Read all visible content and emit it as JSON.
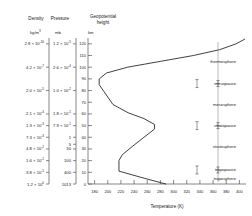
{
  "chart_data": {
    "type": "line",
    "title": "",
    "xlabel": "Temperature (K)",
    "ylabel": "Geopotential height",
    "xlim": [
      170,
      410
    ],
    "ylim": [
      0,
      125
    ],
    "grid": false,
    "legend_position": "none",
    "x_ticks": [
      180,
      200,
      220,
      240,
      260,
      280,
      300,
      320,
      340,
      360,
      380,
      400
    ],
    "y_ticks": [
      0,
      10,
      20,
      30,
      40,
      50,
      60,
      70,
      80,
      90,
      100,
      110,
      120
    ],
    "series": [
      {
        "name": "U.S. Standard Atmosphere temperature profile",
        "x": [
          288,
          255,
          217,
          217,
          222,
          237,
          255,
          271,
          271,
          255,
          231,
          208,
          187,
          187,
          198,
          230,
          280,
          330,
          370,
          395,
          408
        ],
        "y": [
          0,
          5,
          11,
          20,
          25,
          32,
          40,
          47,
          51,
          56,
          61,
          68,
          85,
          90,
          95,
          100,
          105,
          110,
          115,
          120,
          124
        ]
      }
    ],
    "annotations": [
      {
        "label": "thermosphere",
        "height": 105,
        "kind": "layer"
      },
      {
        "label": "mesopause",
        "height": 86,
        "kind": "pause"
      },
      {
        "label": "mesosphere",
        "height": 68,
        "kind": "layer"
      },
      {
        "label": "stratopause",
        "height": 50,
        "kind": "pause"
      },
      {
        "label": "stratosphere",
        "height": 32,
        "kind": "layer"
      },
      {
        "label": "tropopause",
        "height": 12,
        "kind": "pause"
      },
      {
        "label": "troposphere",
        "height": 5,
        "kind": "layer"
      }
    ]
  },
  "columns": {
    "density": {
      "header": "Density",
      "unit_mantissa": "kg/m",
      "unit_exponent": "3",
      "rows": [
        {
          "mantissa": "2.8",
          "exponent": "-10",
          "height": 120
        },
        {
          "mantissa": "4.2",
          "exponent": "-7",
          "height": 100
        },
        {
          "mantissa": "2.0",
          "exponent": "-5",
          "height": 80
        },
        {
          "mantissa": "2.1",
          "exponent": "-4",
          "height": 60
        },
        {
          "mantissa": "1.3",
          "exponent": "-3",
          "height": 50
        },
        {
          "mantissa": "7.3",
          "exponent": "-3",
          "height": 40
        },
        {
          "mantissa": "4.8",
          "exponent": "-2",
          "height": 30
        },
        {
          "mantissa": "1.6",
          "exponent": "-1",
          "height": 20
        },
        {
          "mantissa": "3.8",
          "exponent": "-1",
          "height": 10
        },
        {
          "mantissa": "1.2",
          "exponent": "0",
          "height": 0
        }
      ]
    },
    "pressure": {
      "header": "Pressure",
      "unit": "mb",
      "rows": [
        {
          "mantissa": "1.2",
          "exponent": "-5",
          "height": 120
        },
        {
          "mantissa": "2.6",
          "exponent": "-4",
          "height": 100
        },
        {
          "mantissa": "1.0",
          "exponent": "-2",
          "height": 80
        },
        {
          "mantissa": "1.8",
          "exponent": "-1",
          "height": 60
        },
        {
          "mantissa": "7.9",
          "exponent": "-1",
          "height": 50
        },
        {
          "mantissa": "1",
          "exponent": "",
          "height": 40
        },
        {
          "mantissa": "5",
          "exponent": "",
          "height": 40
        },
        {
          "mantissa": "30",
          "exponent": "",
          "height": 30
        },
        {
          "mantissa": "100",
          "exponent": "",
          "height": 20
        },
        {
          "mantissa": "400",
          "exponent": "",
          "height": 10
        },
        {
          "mantissa": "1013",
          "exponent": "",
          "height": 0
        }
      ]
    },
    "height": {
      "header_line1": "Geopotential",
      "header_line2": "height",
      "unit": "km"
    }
  }
}
